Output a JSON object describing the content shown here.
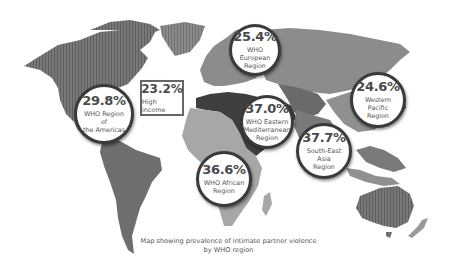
{
  "map": {
    "caption_line1": "Map showing prevalence of intimate partner violence",
    "caption_line2": "by WHO region",
    "colors": {
      "americas": "#6e6e6e",
      "europe": "#8c8c8c",
      "africa": "#a7a7a7",
      "eastern_mediterranean": "#3f3f3f",
      "south_east_asia": "#7a7a7a",
      "western_pacific": "#909090",
      "high_income": "#7c7c7c"
    },
    "regions": [
      {
        "id": "americas",
        "value": "29.8%",
        "label_line1": "WHO Region of",
        "label_line2": "the Americas"
      },
      {
        "id": "high_income",
        "value": "23.2%",
        "label_line1": "High income",
        "label_line2": ""
      },
      {
        "id": "europe",
        "value": "25.4%",
        "label_line1": "WHO European",
        "label_line2": "Region"
      },
      {
        "id": "eastern_mediterranean",
        "value": "37.0%",
        "label_line1": "WHO Eastern",
        "label_line2": "Mediterranean",
        "label_line3": "Region"
      },
      {
        "id": "africa",
        "value": "36.6%",
        "label_line1": "WHO African",
        "label_line2": "Region"
      },
      {
        "id": "south_east_asia",
        "value": "37.7%",
        "label_line1": "South-East Asia",
        "label_line2": "Region"
      },
      {
        "id": "western_pacific",
        "value": "24.6%",
        "label_line1": "Western Pacific",
        "label_line2": "Region"
      }
    ]
  }
}
